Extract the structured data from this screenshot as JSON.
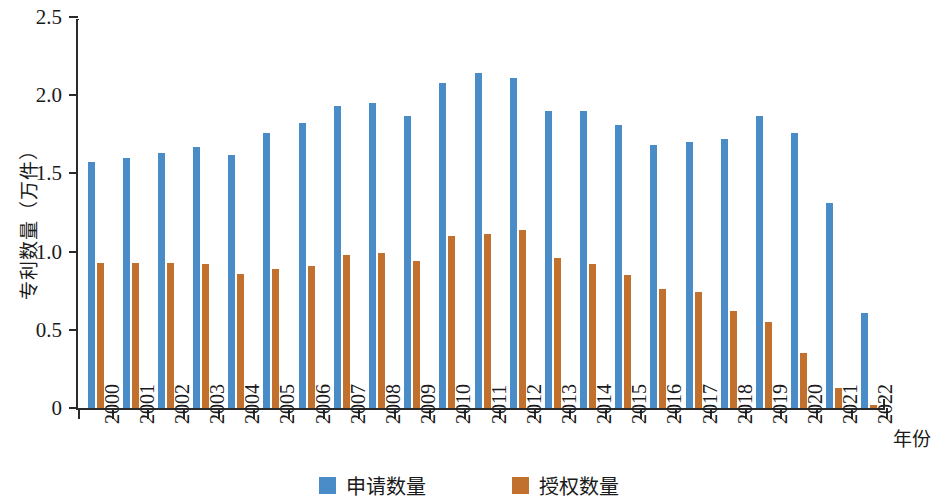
{
  "chart_data": {
    "type": "bar",
    "title": "",
    "xlabel": "年份",
    "ylabel": "专利数量（万件）",
    "ylim": [
      0,
      2.5
    ],
    "yticks": [
      0,
      0.5,
      1.0,
      1.5,
      2.0,
      2.5
    ],
    "ytick_labels": [
      "0",
      "0.5",
      "1.0",
      "1.5",
      "2.0",
      "2.5"
    ],
    "grid": false,
    "legend_position": "bottom-center",
    "categories": [
      "2000",
      "2001",
      "2002",
      "2003",
      "2004",
      "2005",
      "2006",
      "2007",
      "2008",
      "2009",
      "2010",
      "2011",
      "2012",
      "2013",
      "2014",
      "2015",
      "2016",
      "2017",
      "2018",
      "2019",
      "2020",
      "2021",
      "2022"
    ],
    "series": [
      {
        "name": "申请数量",
        "color": "#4a8cc7",
        "values": [
          1.57,
          1.6,
          1.63,
          1.67,
          1.62,
          1.76,
          1.82,
          1.93,
          1.95,
          1.87,
          2.08,
          2.14,
          2.11,
          1.9,
          1.9,
          1.81,
          1.68,
          1.7,
          1.72,
          1.87,
          1.76,
          1.31,
          0.61
        ]
      },
      {
        "name": "授权数量",
        "color": "#c1702e",
        "values": [
          0.93,
          0.93,
          0.93,
          0.92,
          0.86,
          0.89,
          0.91,
          0.98,
          0.99,
          0.94,
          1.1,
          1.11,
          1.14,
          0.96,
          0.92,
          0.85,
          0.76,
          0.74,
          0.62,
          0.55,
          0.35,
          0.13,
          0.02
        ]
      }
    ]
  },
  "legend": {
    "items": [
      {
        "label": "申请数量",
        "color": "#4a8cc7"
      },
      {
        "label": "授权数量",
        "color": "#c1702e"
      }
    ]
  }
}
